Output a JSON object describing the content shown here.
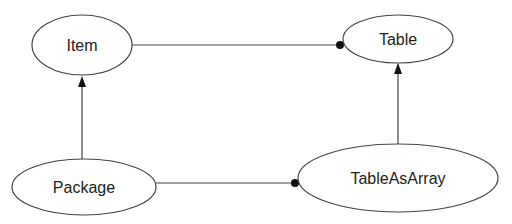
{
  "diagram": {
    "nodes": [
      {
        "id": "item",
        "label": "Item",
        "cx": 82,
        "cy": 45,
        "rx": 50,
        "ry": 30
      },
      {
        "id": "table",
        "label": "Table",
        "cx": 398,
        "cy": 39,
        "rx": 55,
        "ry": 24
      },
      {
        "id": "package",
        "label": "Package",
        "cx": 84,
        "cy": 187,
        "rx": 72,
        "ry": 28
      },
      {
        "id": "tableasarray",
        "label": "TableAsArray",
        "cx": 398,
        "cy": 178,
        "rx": 100,
        "ry": 34
      }
    ],
    "edges": [
      {
        "from": "item",
        "to": "table",
        "end": "dot"
      },
      {
        "from": "package",
        "to": "tableasarray",
        "end": "dot"
      },
      {
        "from": "package",
        "to": "item",
        "end": "arrow"
      },
      {
        "from": "tableasarray",
        "to": "table",
        "end": "arrow"
      }
    ],
    "colors": {
      "stroke": "#444444",
      "text": "#222222",
      "background": "#ffffff"
    }
  }
}
